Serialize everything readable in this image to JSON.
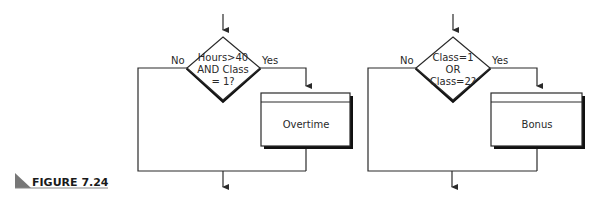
{
  "figure": {
    "label": "FIGURE 7.24"
  },
  "flowcharts": [
    {
      "decision": {
        "lines": [
          "Hours>40",
          "AND Class",
          "= 1?"
        ]
      },
      "no_label": "No",
      "yes_label": "Yes",
      "process": {
        "label": "Overtime"
      }
    },
    {
      "decision": {
        "lines": [
          "Class=1",
          "OR",
          "Class=2?"
        ]
      },
      "no_label": "No",
      "yes_label": "Yes",
      "process": {
        "label": "Bonus"
      }
    }
  ],
  "colors": {
    "stroke": "#2a2a2a",
    "shadow": "#111111",
    "figure_triangle": "#777777"
  }
}
